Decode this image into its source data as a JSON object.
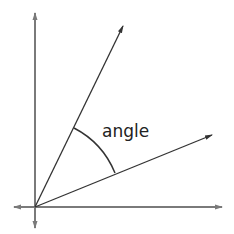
{
  "diagram": {
    "title": "",
    "label": "angle",
    "colors": {
      "axis": "#7a7a7a",
      "ray": "#333333",
      "arc": "#333333",
      "text": "#222222",
      "background": "#ffffff"
    },
    "elements": [
      {
        "type": "axis",
        "name": "vertical-axis",
        "arrows": "both"
      },
      {
        "type": "axis",
        "name": "horizontal-axis",
        "arrows": "both"
      },
      {
        "type": "ray",
        "name": "upper-ray",
        "from": "origin"
      },
      {
        "type": "ray",
        "name": "lower-ray",
        "from": "origin"
      },
      {
        "type": "arc",
        "name": "angle-arc",
        "between": [
          "upper-ray",
          "lower-ray"
        ]
      }
    ]
  }
}
